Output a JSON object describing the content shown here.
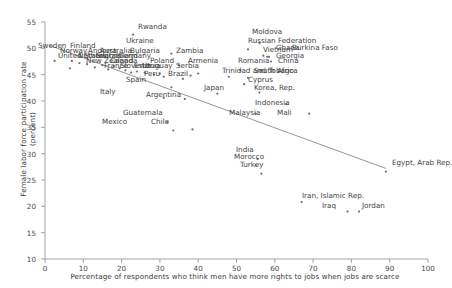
{
  "chart_data": {
    "type": "scatter",
    "title": "",
    "xlabel": "Percentage of respondents who think men have more rights to jobs when jobs are scarce",
    "ylabel": "Female labor force participation rate (percent)",
    "xlim": [
      0,
      100
    ],
    "ylim": [
      10,
      55
    ],
    "xticks": [
      0,
      10,
      20,
      30,
      40,
      50,
      60,
      70,
      80,
      90,
      100
    ],
    "yticks": [
      10,
      15,
      20,
      25,
      30,
      35,
      40,
      45,
      50,
      55
    ],
    "grid": false,
    "legend": "none",
    "marker_color": "#6f6f6f",
    "trendline": {
      "label": "linear fit",
      "color": "#8a8a8a",
      "x0": 1,
      "y0": 50.6,
      "x1": 89,
      "y1": 27.2
    },
    "points": [
      {
        "label": "Sweden",
        "x": 2.5,
        "y": 47.6,
        "lx": 38,
        "ly": 42
      },
      {
        "label": "Finland",
        "x": 7.0,
        "y": 47.6,
        "lx": 70,
        "ly": 42
      },
      {
        "label": "United States",
        "x": 6.5,
        "y": 46.2,
        "lx": 58,
        "ly": 52
      },
      {
        "label": "Norway",
        "x": 9.0,
        "y": 47.2,
        "lx": 60,
        "ly": 47
      },
      {
        "label": "Netherlands",
        "x": 13.0,
        "y": 46.4,
        "lx": 78,
        "ly": 52
      },
      {
        "label": "Andorra",
        "x": 11.0,
        "y": 47.0,
        "lx": 88,
        "ly": 47
      },
      {
        "label": "Australia",
        "x": 15.0,
        "y": 46.8,
        "lx": 100,
        "ly": 47
      },
      {
        "label": "Switzerland",
        "x": 16.5,
        "y": 46.0,
        "lx": 96,
        "ly": 52
      },
      {
        "label": "New Zealand",
        "x": 18.0,
        "y": 46.6,
        "lx": 86,
        "ly": 57
      },
      {
        "label": "Canada",
        "x": 19.5,
        "y": 46.2,
        "lx": 110,
        "ly": 57
      },
      {
        "label": "Germany",
        "x": 21.0,
        "y": 45.8,
        "lx": 118,
        "ly": 52
      },
      {
        "label": "France",
        "x": 22.5,
        "y": 45.4,
        "lx": 104,
        "ly": 62
      },
      {
        "label": "Bulgaria",
        "x": 27.0,
        "y": 47.0,
        "lx": 130,
        "ly": 47
      },
      {
        "label": "Zambia",
        "x": 35.0,
        "y": 46.8,
        "lx": 176,
        "ly": 47
      },
      {
        "label": "Slovenia",
        "x": 24.0,
        "y": 45.6,
        "lx": 120,
        "ly": 62
      },
      {
        "label": "Estonia",
        "x": 26.0,
        "y": 45.4,
        "lx": 134,
        "ly": 62
      },
      {
        "label": "Uruguay",
        "x": 28.5,
        "y": 45.0,
        "lx": 142,
        "ly": 62
      },
      {
        "label": "Poland",
        "x": 30.0,
        "y": 45.2,
        "lx": 150,
        "ly": 57
      },
      {
        "label": "Moldova",
        "x": 56.0,
        "y": 51.0,
        "lx": 252,
        "ly": 28
      },
      {
        "label": "Rwanda",
        "x": 23.0,
        "y": 52.6,
        "lx": 138,
        "ly": 23
      },
      {
        "label": "Ukraine",
        "x": 33.0,
        "y": 49.0,
        "lx": 126,
        "ly": 37
      },
      {
        "label": "Russian Federation",
        "x": 53.0,
        "y": 49.8,
        "lx": 248,
        "ly": 37
      },
      {
        "label": "Vietnam",
        "x": 57.0,
        "y": 48.6,
        "lx": 263,
        "ly": 46
      },
      {
        "label": "Burkina Faso",
        "x": 58.5,
        "y": 48.4,
        "lx": 292,
        "ly": 44
      },
      {
        "label": "Ghana",
        "x": 58.0,
        "y": 48.4,
        "lx": 276,
        "ly": 44
      },
      {
        "label": "Georgia",
        "x": 59.0,
        "y": 47.5,
        "lx": 276,
        "ly": 52
      },
      {
        "label": "Romania",
        "x": 51.0,
        "y": 45.8,
        "lx": 238,
        "ly": 57
      },
      {
        "label": "China",
        "x": 56.5,
        "y": 45.8,
        "lx": 278,
        "ly": 57
      },
      {
        "label": "Armenia",
        "x": 40.0,
        "y": 45.2,
        "lx": 188,
        "ly": 57
      },
      {
        "label": "Serbia",
        "x": 38.0,
        "y": 44.8,
        "lx": 176,
        "ly": 62
      },
      {
        "label": "Trinidad and Tobago",
        "x": 48.0,
        "y": 44.6,
        "lx": 222,
        "ly": 67
      },
      {
        "label": "South Africa",
        "x": 53.0,
        "y": 44.4,
        "lx": 254,
        "ly": 67
      },
      {
        "label": "Peru",
        "x": 31.0,
        "y": 44.6,
        "lx": 144,
        "ly": 70
      },
      {
        "label": "Brazil",
        "x": 36.0,
        "y": 44.2,
        "lx": 168,
        "ly": 70
      },
      {
        "label": "Cyprus",
        "x": 52.0,
        "y": 43.2,
        "lx": 248,
        "ly": 76
      },
      {
        "label": "Spain",
        "x": 33.0,
        "y": 42.6,
        "lx": 126,
        "ly": 76
      },
      {
        "label": "Korea, Rep.",
        "x": 56.0,
        "y": 41.6,
        "lx": 254,
        "ly": 84
      },
      {
        "label": "Japan",
        "x": 45.0,
        "y": 41.4,
        "lx": 204,
        "ly": 84
      },
      {
        "label": "Argentina",
        "x": 36.5,
        "y": 40.4,
        "lx": 146,
        "ly": 91
      },
      {
        "label": "Italy",
        "x": 31.0,
        "y": 40.6,
        "lx": 100,
        "ly": 88
      },
      {
        "label": "Indonesia",
        "x": 63.0,
        "y": 39.4,
        "lx": 255,
        "ly": 99
      },
      {
        "label": "Mali",
        "x": 69.0,
        "y": 37.6,
        "lx": 277,
        "ly": 109
      },
      {
        "label": "Malaysia",
        "x": 55.0,
        "y": 37.6,
        "lx": 229,
        "ly": 109
      },
      {
        "label": "Guatemala",
        "x": 32.0,
        "y": 36.0,
        "lx": 123,
        "ly": 109
      },
      {
        "label": "Chile",
        "x": 38.5,
        "y": 34.6,
        "lx": 151,
        "ly": 118
      },
      {
        "label": "Mexico",
        "x": 33.5,
        "y": 34.4,
        "lx": 102,
        "ly": 118
      },
      {
        "label": "India",
        "x": 55.5,
        "y": 29.0,
        "lx": 236,
        "ly": 146
      },
      {
        "label": "Morocco",
        "x": 55.0,
        "y": 27.8,
        "lx": 234,
        "ly": 153
      },
      {
        "label": "Turkey",
        "x": 56.5,
        "y": 26.2,
        "lx": 240,
        "ly": 161
      },
      {
        "label": "Egypt, Arab Rep.",
        "x": 89.0,
        "y": 26.6,
        "lx": 392,
        "ly": 159
      },
      {
        "label": "Iran, Islamic Rep.",
        "x": 67.0,
        "y": 20.8,
        "lx": 302,
        "ly": 192
      },
      {
        "label": "Iraq",
        "x": 79.0,
        "y": 19.0,
        "lx": 322,
        "ly": 202
      },
      {
        "label": "Jordan",
        "x": 82.0,
        "y": 19.0,
        "lx": 362,
        "ly": 202
      }
    ]
  }
}
